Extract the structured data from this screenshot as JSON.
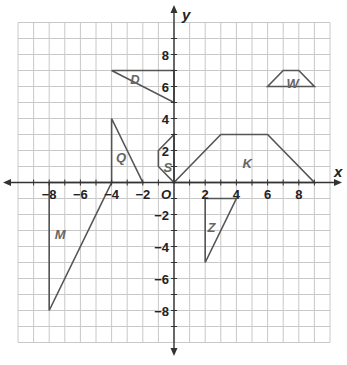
{
  "chart_data": {
    "type": "coordinate-plane",
    "title": "",
    "xlabel": "x",
    "ylabel": "y",
    "origin_label": "O",
    "xlim": [
      -10,
      10
    ],
    "ylim": [
      -10,
      10
    ],
    "grid": true,
    "x_ticks": [
      -8,
      -6,
      -4,
      -2,
      2,
      4,
      6,
      8
    ],
    "y_ticks": [
      -8,
      -6,
      -4,
      -2,
      2,
      4,
      6,
      8
    ],
    "x_tick_labels": [
      "−8",
      "−6",
      "−4",
      "−2",
      "2",
      "4",
      "6",
      "8"
    ],
    "y_tick_labels": [
      "−8",
      "−6",
      "−4",
      "−2",
      "2",
      "4",
      "6",
      "8"
    ],
    "shapes": [
      {
        "name": "D",
        "vertices": [
          [
            -4,
            7
          ],
          [
            0,
            7
          ],
          [
            0,
            5
          ]
        ],
        "label_at": [
          -2.5,
          6.5
        ]
      },
      {
        "name": "Q",
        "vertices": [
          [
            -4,
            4
          ],
          [
            -4,
            0
          ],
          [
            -2,
            0
          ]
        ],
        "label_at": [
          -3.4,
          1.6
        ]
      },
      {
        "name": "S",
        "vertices": [
          [
            0,
            3
          ],
          [
            -1,
            2
          ],
          [
            -1,
            1
          ],
          [
            0,
            0
          ]
        ],
        "label_at": [
          -0.4,
          1.0
        ]
      },
      {
        "name": "K",
        "vertices": [
          [
            0,
            0
          ],
          [
            3,
            3
          ],
          [
            6,
            3
          ],
          [
            9,
            0
          ]
        ],
        "label_at": [
          4.7,
          1.2
        ]
      },
      {
        "name": "W",
        "vertices": [
          [
            6,
            6
          ],
          [
            7,
            7
          ],
          [
            8,
            7
          ],
          [
            9,
            6
          ]
        ],
        "label_at": [
          7.6,
          6.2
        ]
      },
      {
        "name": "Z",
        "vertices": [
          [
            2,
            -1
          ],
          [
            4,
            -1
          ],
          [
            2,
            -5
          ]
        ],
        "label_at": [
          2.4,
          -2.8
        ]
      },
      {
        "name": "M",
        "vertices": [
          [
            -8,
            0
          ],
          [
            -4,
            0
          ],
          [
            -8,
            -8
          ]
        ],
        "label_at": [
          -7.3,
          -3.2
        ]
      }
    ]
  },
  "colors": {
    "grid": "#c8c8c8",
    "axis": "#333333",
    "shape_stroke": "#555555",
    "shape_label": "#666666"
  }
}
